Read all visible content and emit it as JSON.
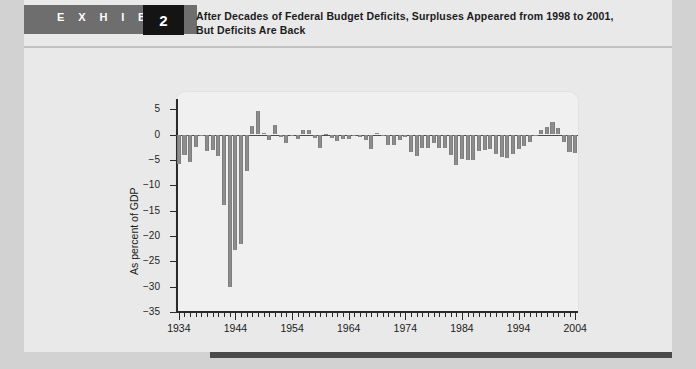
{
  "header": {
    "exhibit_label": "E X H I B I T",
    "exhibit_number": "2",
    "title_line1": "After Decades of Federal Budget Deficits, Surpluses Appeared from 1998 to 2001,",
    "title_line2": "But Deficits Are Back"
  },
  "colors": {
    "exhibit_bar": "#6e6e6e",
    "exhibit_number_box": "#141414",
    "page": "#e9e9e9",
    "bar": "#8d8d8d",
    "axis": "#2a2a2a"
  },
  "chart_data": {
    "type": "bar",
    "title": "After Decades of Federal Budget Deficits, Surpluses Appeared from 1998 to 2001, But Deficits Are Back",
    "xlabel": "",
    "ylabel": "As percent of GDP",
    "ylim": [
      -35,
      7
    ],
    "xlim": [
      1933.5,
      2004.5
    ],
    "ytick_labels": [
      "5",
      "0",
      "-5",
      "-10",
      "-15",
      "-20",
      "-25",
      "-30",
      "-35"
    ],
    "ytick_values": [
      5,
      0,
      -5,
      -10,
      -15,
      -20,
      -25,
      -30,
      -35
    ],
    "xtick_labels": [
      "1934",
      "1944",
      "1954",
      "1964",
      "1974",
      "1984",
      "1994",
      "2004"
    ],
    "xtick_values": [
      1934,
      1944,
      1954,
      1964,
      1974,
      1984,
      1994,
      2004
    ],
    "minor_xticks": 1,
    "grid": false,
    "legend": false,
    "series": [
      {
        "name": "Federal budget surplus/deficit as percent of GDP",
        "x": [
          1934,
          1935,
          1936,
          1937,
          1938,
          1939,
          1940,
          1941,
          1942,
          1943,
          1944,
          1945,
          1946,
          1947,
          1948,
          1949,
          1950,
          1951,
          1952,
          1953,
          1954,
          1955,
          1956,
          1957,
          1958,
          1959,
          1960,
          1961,
          1962,
          1963,
          1964,
          1965,
          1966,
          1967,
          1968,
          1969,
          1970,
          1971,
          1972,
          1973,
          1974,
          1975,
          1976,
          1977,
          1978,
          1979,
          1980,
          1981,
          1982,
          1983,
          1984,
          1985,
          1986,
          1987,
          1988,
          1989,
          1990,
          1991,
          1992,
          1993,
          1994,
          1995,
          1996,
          1997,
          1998,
          1999,
          2000,
          2001,
          2002,
          2003,
          2004
        ],
        "values": [
          -5.9,
          -4.0,
          -5.5,
          -2.5,
          -0.1,
          -3.2,
          -3.0,
          -4.3,
          -13.9,
          -30.0,
          -22.7,
          -21.5,
          -7.2,
          1.7,
          4.6,
          0.2,
          -1.1,
          1.9,
          -0.4,
          -1.7,
          -0.3,
          -0.8,
          0.9,
          0.8,
          -0.6,
          -2.6,
          0.1,
          -0.6,
          -1.3,
          -0.8,
          -0.9,
          -0.2,
          -0.5,
          -1.1,
          -2.9,
          0.3,
          -0.3,
          -2.1,
          -2.0,
          -1.1,
          -0.4,
          -3.4,
          -4.2,
          -2.7,
          -2.7,
          -1.6,
          -2.7,
          -2.6,
          -4.0,
          -6.0,
          -4.8,
          -5.1,
          -5.0,
          -3.2,
          -3.1,
          -2.8,
          -3.9,
          -4.5,
          -4.7,
          -3.9,
          -2.9,
          -2.2,
          -1.4,
          -0.3,
          0.8,
          1.4,
          2.4,
          1.3,
          -1.5,
          -3.5,
          -3.6
        ]
      }
    ]
  }
}
